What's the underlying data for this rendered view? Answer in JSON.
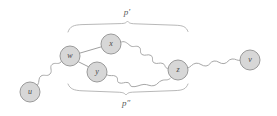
{
  "figure": {
    "kind": "graph-diagram",
    "background_color": "#ffffff",
    "node_fill_color": "#d7d7d7",
    "node_stroke_color": "#9a9a9a",
    "edge_color": "#a8a8a8",
    "brace_color": "#b0b0b0",
    "label_color": "#4a4a4a"
  },
  "nodes": [
    {
      "id": "u",
      "label": "u",
      "cx": 30,
      "cy": 92,
      "r": 10
    },
    {
      "id": "w",
      "label": "w",
      "cx": 70,
      "cy": 56,
      "r": 10
    },
    {
      "id": "x",
      "label": "x",
      "cx": 111,
      "cy": 44,
      "r": 10
    },
    {
      "id": "y",
      "label": "y",
      "cx": 97,
      "cy": 72,
      "r": 10
    },
    {
      "id": "z",
      "label": "z",
      "cx": 178,
      "cy": 70,
      "r": 10
    },
    {
      "id": "v",
      "label": "v",
      "cx": 250,
      "cy": 60,
      "r": 10
    }
  ],
  "edges": [
    {
      "from": "u",
      "to": "w",
      "style": "wavy"
    },
    {
      "from": "w",
      "to": "x",
      "style": "straight"
    },
    {
      "from": "w",
      "to": "y",
      "style": "straight"
    },
    {
      "from": "x",
      "to": "z",
      "style": "wavy"
    },
    {
      "from": "y",
      "to": "z",
      "style": "wavy"
    },
    {
      "from": "z",
      "to": "v",
      "style": "wavy"
    }
  ],
  "braces": [
    {
      "id": "p-prime",
      "label": "p′",
      "orientation": "top",
      "span_start_x": 68,
      "span_end_x": 188,
      "label_x": 127,
      "label_y": 13
    },
    {
      "id": "p-double-prime",
      "label": "p″",
      "orientation": "bottom",
      "span_start_x": 68,
      "span_end_x": 188,
      "label_x": 126,
      "label_y": 104
    }
  ]
}
